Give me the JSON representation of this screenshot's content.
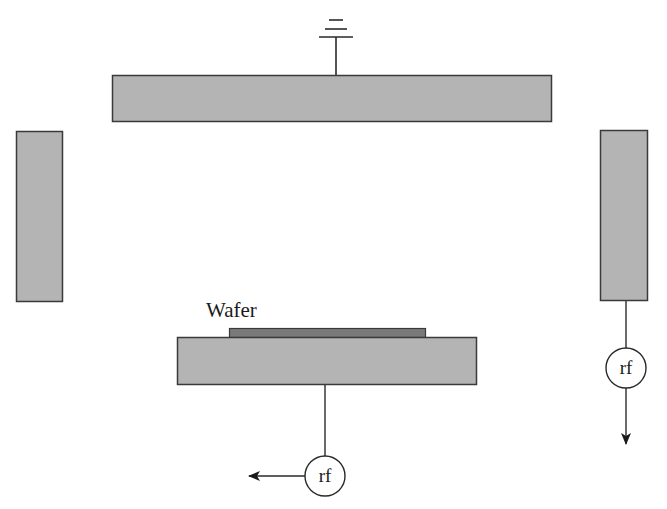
{
  "diagram": {
    "type": "plasma-reactor-electrode-schematic",
    "colors": {
      "electrode_fill": "#b4b4b4",
      "electrode_stroke": "#3a3a3a",
      "wafer_fill": "#7a7a7a",
      "line": "#2a2a2a",
      "background": "#ffffff"
    },
    "labels": {
      "wafer": "Wafer",
      "rf_bottom": "rf",
      "rf_right": "rf"
    },
    "components": [
      {
        "id": "top-electrode",
        "kind": "electrode",
        "connection": "ground"
      },
      {
        "id": "left-electrode",
        "kind": "electrode"
      },
      {
        "id": "right-electrode",
        "kind": "electrode",
        "connection": "rf source"
      },
      {
        "id": "bottom-electrode",
        "kind": "electrode",
        "connection": "rf source",
        "holds": "Wafer"
      },
      {
        "id": "wafer",
        "kind": "substrate"
      },
      {
        "id": "ground-symbol",
        "kind": "ground"
      },
      {
        "id": "rf-source-bottom",
        "kind": "rf source",
        "arrow": "left"
      },
      {
        "id": "rf-source-right",
        "kind": "rf source",
        "arrow": "down"
      }
    ]
  }
}
